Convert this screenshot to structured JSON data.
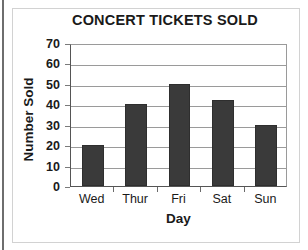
{
  "chart_data": {
    "type": "bar",
    "title": "CONCERT TICKETS SOLD",
    "xlabel": "Day",
    "ylabel": "Number Sold",
    "categories": [
      "Wed",
      "Thur",
      "Fri",
      "Sat",
      "Sun"
    ],
    "values": [
      20,
      40,
      50,
      42,
      30
    ],
    "series": [
      {
        "name": "Number Sold",
        "values": [
          20,
          40,
          50,
          42,
          30
        ]
      }
    ],
    "ylim": [
      0,
      70
    ],
    "ytick_interval": 10,
    "yticks": [
      0,
      10,
      20,
      30,
      40,
      50,
      60,
      70
    ],
    "ytick_labels": [
      "0",
      "10",
      "20",
      "30",
      "40",
      "50",
      "60",
      "70"
    ],
    "grid": true,
    "grid_axis": "y",
    "legend": false,
    "legend_position": "none",
    "bar_color": "#3a3a3a",
    "gridline_color": "#9a9a9a",
    "axis_color": "#555555",
    "text_color": "#1a1a1a",
    "background_color": "#ffffff"
  }
}
